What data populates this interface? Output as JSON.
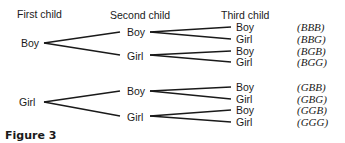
{
  "headers": {
    "first": "First child",
    "second": "Second child",
    "third": "Third child"
  },
  "tree": {
    "first": [
      "Boy",
      "Girl"
    ],
    "second": [
      "Boy",
      "Girl",
      "Boy",
      "Girl"
    ],
    "third": [
      "Boy",
      "Girl",
      "Boy",
      "Girl",
      "Boy",
      "Girl",
      "Boy",
      "Girl"
    ],
    "outcomes": [
      "(BBB)",
      "(BBG)",
      "(BGB)",
      "(BGG)",
      "(GBB)",
      "(GBG)",
      "(GGB)",
      "(GGG)"
    ]
  },
  "caption": "Figure 3"
}
